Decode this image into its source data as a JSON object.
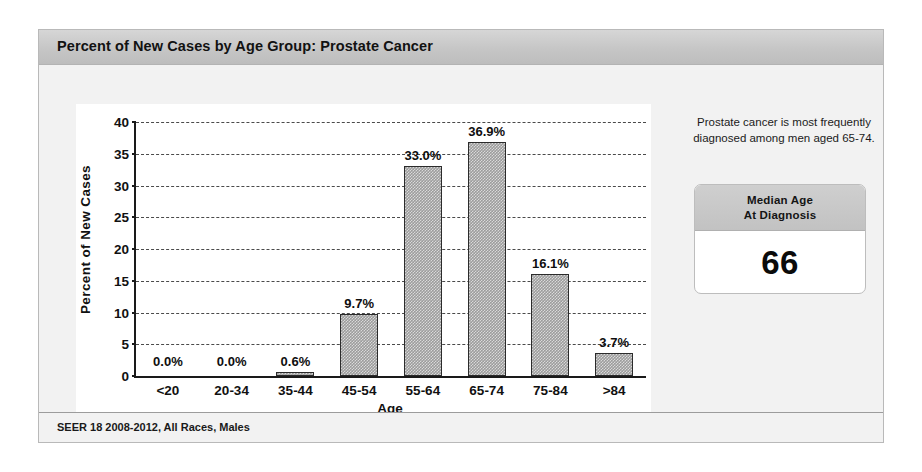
{
  "panel": {
    "title": "Percent of New Cases by Age Group: Prostate Cancer",
    "footer": "SEER 18 2008-2012, All Races, Males"
  },
  "side": {
    "note": "Prostate cancer is most frequently diagnosed among men aged 65-74.",
    "median_label_line1": "Median Age",
    "median_label_line2": "At Diagnosis",
    "median_value": "66"
  },
  "colors": {
    "bar_fill": "#9c9c9c",
    "bar_border": "#2b2b2b",
    "header_band": "#c6c6c6",
    "panel_background": "#f2f2f2",
    "text": "#111111"
  },
  "chart_data": {
    "type": "bar",
    "title": "Percent of New Cases by Age Group: Prostate Cancer",
    "categories": [
      "<20",
      "20-34",
      "35-44",
      "45-54",
      "55-64",
      "65-74",
      "75-84",
      ">84"
    ],
    "values": [
      0.0,
      0.0,
      0.6,
      9.7,
      33.0,
      36.9,
      16.1,
      3.7
    ],
    "value_labels": [
      "0.0%",
      "0.0%",
      "0.6%",
      "9.7%",
      "33.0%",
      "36.9%",
      "16.1%",
      "3.7%"
    ],
    "xlabel": "Age",
    "ylabel": "Percent of New Cases",
    "ylim": [
      0,
      40
    ],
    "yticks": [
      0,
      5,
      10,
      15,
      20,
      25,
      30,
      35,
      40
    ],
    "ytick_labels": [
      "0",
      "5",
      "10",
      "15",
      "20",
      "25",
      "30",
      "35",
      "40"
    ],
    "grid": true,
    "grid_style": "dashed horizontal",
    "legend": "none",
    "source": "SEER 18 2008-2012, All Races, Males"
  }
}
